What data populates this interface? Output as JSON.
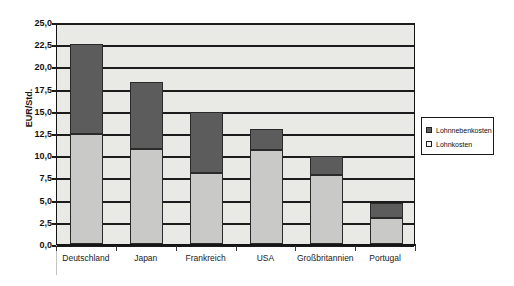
{
  "chart_data": {
    "type": "bar",
    "stacked": true,
    "title": "",
    "subtitle": "",
    "xlabel": "",
    "ylabel": "EUR/Std.",
    "categories": [
      "Deutschland",
      "Japan",
      "Frankreich",
      "USA",
      "Großbritannien",
      "Portugal"
    ],
    "series": [
      {
        "name": "Lohnkosten",
        "color": "#c9c9c7",
        "values": [
          12.4,
          10.7,
          8.0,
          10.6,
          7.8,
          2.9
        ]
      },
      {
        "name": "Lohnnebenkosten",
        "color": "#5c5c5c",
        "values": [
          10.1,
          7.5,
          6.9,
          2.3,
          2.1,
          1.7
        ]
      }
    ],
    "totals": [
      22.5,
      18.2,
      14.9,
      12.9,
      9.9,
      4.6
    ],
    "ylim": [
      0.0,
      25.0
    ],
    "ytick_values": [
      0.0,
      2.5,
      5.0,
      7.5,
      10.0,
      12.5,
      15.0,
      17.5,
      20.0,
      22.5,
      25.0
    ],
    "ytick_labels": [
      "0,0",
      "2,5",
      "5,0",
      "7,5",
      "10,0",
      "12,5",
      "15,0",
      "17,5",
      "20,0",
      "22,5",
      "25,0"
    ],
    "grid": true,
    "legend_position": "right",
    "legend_entries": [
      "Lohnnebenkosten",
      "Lohnkosten"
    ]
  },
  "legend": {
    "entries": [
      {
        "label": "Lohnnebenkosten",
        "swatch": "dark"
      },
      {
        "label": "Lohnkosten",
        "swatch": "light"
      }
    ]
  },
  "axes": {
    "y_title": "EUR/Std."
  }
}
